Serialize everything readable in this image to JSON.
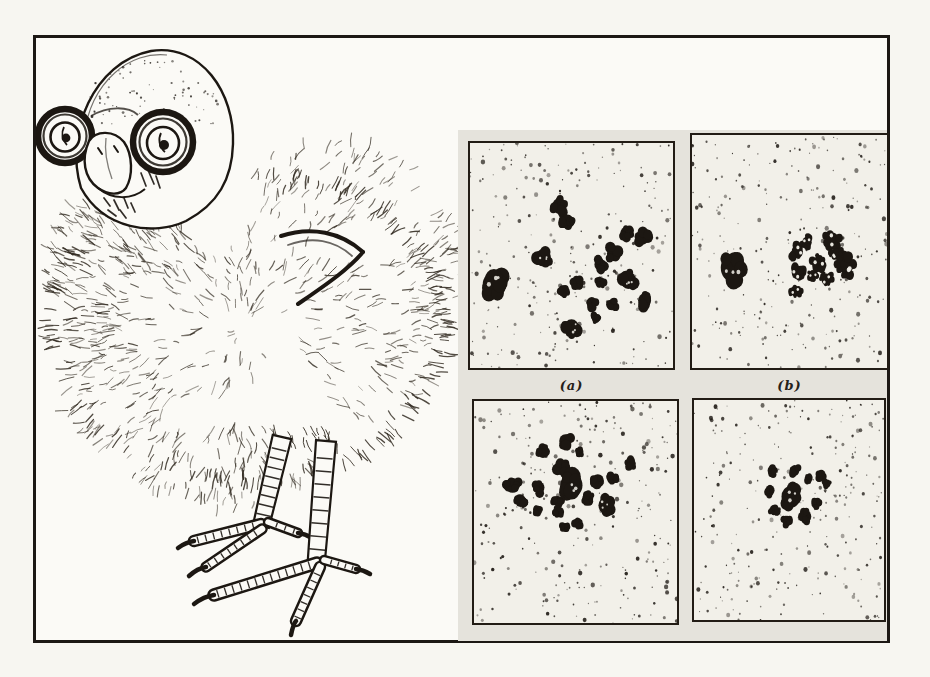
{
  "figure": {
    "labels": {
      "top_left_panel": "(a)",
      "top_right_panel": "(b)"
    }
  },
  "colors": {
    "ink": "#1c1712",
    "paper": "#fbfaf6",
    "panel_bg": "#f2f0e9",
    "backing": "#e5e3dc"
  },
  "chart_data": {
    "type": "scatter",
    "title": "",
    "note_visible_text": [
      "(a)",
      "(b)"
    ],
    "panels": [
      {
        "id": "a",
        "label": "(a)",
        "blobs": [
          [
            12,
            63,
            7.2
          ],
          [
            44,
            28,
            4.4
          ],
          [
            48,
            35,
            4.0
          ],
          [
            77,
            40,
            3.6
          ],
          [
            85,
            42,
            4.0
          ],
          [
            36,
            51,
            4.8
          ],
          [
            71,
            49,
            4.4
          ],
          [
            64,
            54,
            3.4
          ],
          [
            78,
            61,
            4.8
          ],
          [
            53,
            62,
            3.4
          ],
          [
            64,
            62,
            2.8
          ],
          [
            46,
            66,
            2.9
          ],
          [
            60,
            71,
            3.2
          ],
          [
            70,
            72,
            2.9
          ],
          [
            86,
            70,
            4.0
          ],
          [
            62,
            78,
            2.5
          ],
          [
            50,
            82,
            4.6
          ]
        ]
      },
      {
        "id": "b",
        "label": "(b)",
        "blobs": [
          [
            21,
            57,
            7.8
          ],
          [
            54,
            50,
            3.6,
            1
          ],
          [
            59,
            46,
            3.0,
            1
          ],
          [
            72,
            45,
            4.0,
            1
          ],
          [
            79,
            56,
            4.6,
            1
          ],
          [
            65,
            55,
            3.8,
            1
          ],
          [
            54,
            59,
            3.6,
            1
          ],
          [
            69,
            62,
            3.2,
            1
          ],
          [
            53,
            67,
            2.9,
            1
          ],
          [
            74,
            51,
            3.0,
            1
          ],
          [
            62,
            60,
            2.6,
            1
          ]
        ]
      },
      {
        "id": "c",
        "label": "",
        "blobs": [
          [
            45,
            18,
            3.8
          ],
          [
            34,
            23,
            3.4
          ],
          [
            52,
            23,
            2.4
          ],
          [
            43,
            30,
            4.2
          ],
          [
            77,
            28,
            3.0
          ],
          [
            19,
            38,
            4.2
          ],
          [
            68,
            35,
            3.0
          ],
          [
            48,
            38,
            6.8
          ],
          [
            32,
            39,
            3.4
          ],
          [
            61,
            36,
            3.8
          ],
          [
            23,
            45,
            3.4
          ],
          [
            41,
            45,
            2.8
          ],
          [
            56,
            44,
            3.4
          ],
          [
            65,
            47,
            4.6
          ],
          [
            31,
            49,
            2.4
          ],
          [
            42,
            50,
            3.0
          ],
          [
            51,
            55,
            2.8
          ],
          [
            45,
            57,
            2.5
          ]
        ]
      },
      {
        "id": "d",
        "label": "",
        "blobs": [
          [
            41,
            32,
            2.8
          ],
          [
            53,
            32,
            3.0
          ],
          [
            67,
            34,
            2.8
          ],
          [
            60,
            36,
            2.3
          ],
          [
            70,
            38,
            2.3
          ],
          [
            40,
            41,
            3.0
          ],
          [
            51,
            44,
            6.2
          ],
          [
            64,
            47,
            2.8
          ],
          [
            42,
            50,
            2.8
          ],
          [
            49,
            55,
            3.0
          ],
          [
            59,
            53,
            3.4
          ]
        ]
      }
    ]
  }
}
